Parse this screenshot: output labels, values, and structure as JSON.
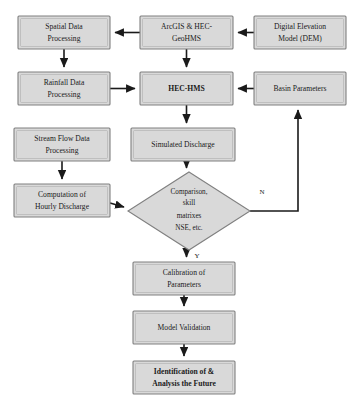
{
  "diagram": {
    "type": "flowchart",
    "colors": {
      "node_fill": "#d9d9d9",
      "node_border": "#808080",
      "edge": "#1a1a1a",
      "background": "#ffffff",
      "text": "#1a1a1a"
    },
    "nodes": [
      {
        "id": "spatial-data-processing",
        "shape": "rect",
        "bold": false,
        "lines": [
          "Spatial Data",
          "Processing"
        ],
        "x": 18,
        "y": 16,
        "w": 92,
        "h": 33
      },
      {
        "id": "arcgis-hec-geohms",
        "shape": "rect",
        "bold": false,
        "lines": [
          "ArcGIS & HEC-",
          "GeoHMS"
        ],
        "x": 140,
        "y": 16,
        "w": 93,
        "h": 33
      },
      {
        "id": "digital-elevation-model",
        "shape": "rect",
        "bold": false,
        "lines": [
          "Digital Elevation",
          "Model (DEM)"
        ],
        "x": 254,
        "y": 16,
        "w": 92,
        "h": 33
      },
      {
        "id": "rainfall-data-processing",
        "shape": "rect",
        "bold": false,
        "lines": [
          "Rainfall Data",
          "Processing"
        ],
        "x": 18,
        "y": 72,
        "w": 92,
        "h": 33
      },
      {
        "id": "hec-hms",
        "shape": "rect",
        "bold": true,
        "lines": [
          "HEC-HMS"
        ],
        "x": 140,
        "y": 72,
        "w": 93,
        "h": 33
      },
      {
        "id": "basin-parameters",
        "shape": "rect",
        "bold": false,
        "lines": [
          "Basin Parameters"
        ],
        "x": 254,
        "y": 72,
        "w": 92,
        "h": 33
      },
      {
        "id": "stream-flow-data-processing",
        "shape": "rect",
        "bold": false,
        "lines": [
          "Stream Flow Data",
          "Processing"
        ],
        "x": 14,
        "y": 128,
        "w": 96,
        "h": 33
      },
      {
        "id": "simulated-discharge",
        "shape": "rect",
        "bold": false,
        "lines": [
          "Simulated Discharge"
        ],
        "x": 131,
        "y": 128,
        "w": 104,
        "h": 33
      },
      {
        "id": "computation-of-hourly-discharge",
        "shape": "rect",
        "bold": false,
        "lines": [
          "Computation of",
          "Hourly Discharge"
        ],
        "x": 14,
        "y": 184,
        "w": 96,
        "h": 33
      },
      {
        "id": "calibration-of-parameters",
        "shape": "rect",
        "bold": false,
        "lines": [
          "Calibration of",
          "Parameters"
        ],
        "x": 133,
        "y": 262,
        "w": 102,
        "h": 33
      },
      {
        "id": "model-validation",
        "shape": "rect",
        "bold": false,
        "lines": [
          "Model Validation"
        ],
        "x": 133,
        "y": 311,
        "w": 102,
        "h": 33
      },
      {
        "id": "identification-analysis-future",
        "shape": "rect",
        "bold": true,
        "lines": [
          "Identification of &",
          "Analysis the Future"
        ],
        "x": 133,
        "y": 361,
        "w": 102,
        "h": 33
      }
    ],
    "decision": {
      "id": "comparison-skill-matrixes",
      "shape": "diamond",
      "lines": [
        "Comparison,",
        "skill",
        "matrixes",
        "NSE, etc."
      ],
      "cx": 189,
      "cy": 211,
      "rx": 61,
      "ry": 39
    },
    "edge_labels": [
      {
        "id": "edge-label-no",
        "text": "N",
        "x": 262,
        "y": 192
      },
      {
        "id": "edge-label-yes",
        "text": "Y",
        "x": 197,
        "y": 256
      }
    ]
  }
}
